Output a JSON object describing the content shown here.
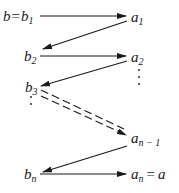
{
  "diagram": {
    "title": "",
    "nodes": {
      "b_start": {
        "prefix": "b",
        "eq": "=",
        "main": "b",
        "sub": "1"
      },
      "a1": {
        "main": "a",
        "sub": "1"
      },
      "b2": {
        "main": "b",
        "sub": "2"
      },
      "a2": {
        "main": "a",
        "sub": "2"
      },
      "b3": {
        "main": "b",
        "sub": "3"
      },
      "an1": {
        "main": "a",
        "sub": "n − 1"
      },
      "bn": {
        "main": "b",
        "sub": "n"
      },
      "an_end": {
        "main": "a",
        "sub": "n",
        "eq": "=",
        "suffix": "a"
      }
    },
    "edges": [
      {
        "from": "b1",
        "to": "a1",
        "style": "solid"
      },
      {
        "from": "a1",
        "to": "b2",
        "style": "solid"
      },
      {
        "from": "b2",
        "to": "a2",
        "style": "solid"
      },
      {
        "from": "a2",
        "to": "b3",
        "style": "solid"
      },
      {
        "from": "b3",
        "to": "an1",
        "style": "dashed-double"
      },
      {
        "from": "an1",
        "to": "bn",
        "style": "solid"
      },
      {
        "from": "bn",
        "to": "an",
        "style": "solid"
      }
    ],
    "colors": {
      "ink": "#1a1a1a",
      "background": "#ffffff"
    }
  }
}
